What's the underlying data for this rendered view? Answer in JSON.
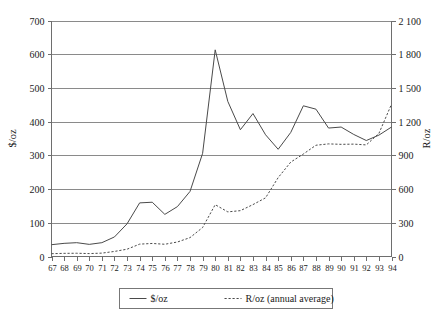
{
  "chart_data": {
    "type": "line",
    "title": "",
    "xlabel": "",
    "ylabel": "$/oz",
    "y2label": "R/oz",
    "grid": true,
    "legend_position": "bottom-center",
    "x": [
      "67",
      "68",
      "69",
      "70",
      "71",
      "72",
      "73",
      "74",
      "75",
      "76",
      "77",
      "78",
      "79",
      "80",
      "81",
      "82",
      "83",
      "84",
      "85",
      "86",
      "87",
      "88",
      "89",
      "90",
      "91",
      "92",
      "93",
      "94"
    ],
    "xlim": [
      67,
      94
    ],
    "ylim": [
      0,
      700
    ],
    "y2lim": [
      0,
      2100
    ],
    "yticks": [
      "0",
      "100",
      "200",
      "300",
      "400",
      "500",
      "600",
      "700"
    ],
    "ytick_values": [
      0,
      100,
      200,
      300,
      400,
      500,
      600,
      700
    ],
    "y2ticks": [
      "0",
      "300",
      "600",
      "900",
      "1 200",
      "1 500",
      "1 800",
      "2 100"
    ],
    "y2tick_values": [
      0,
      300,
      600,
      900,
      1200,
      1500,
      1800,
      2100
    ],
    "series": [
      {
        "name": "$/oz",
        "style": "solid",
        "axis": "left",
        "values": [
          35,
          39,
          41,
          36,
          41,
          58,
          97,
          159,
          161,
          125,
          148,
          193,
          306,
          613,
          460,
          376,
          424,
          361,
          318,
          368,
          447,
          437,
          381,
          384,
          362,
          344,
          360,
          384
        ]
      },
      {
        "name": "R/oz (annual average)",
        "style": "dashed",
        "axis": "right",
        "values": [
          25,
          28,
          29,
          26,
          30,
          45,
          65,
          110,
          116,
          109,
          129,
          168,
          258,
          461,
          397,
          408,
          462,
          522,
          702,
          840,
          912,
          990,
          1002,
          998,
          1000,
          993,
          1095,
          1355
        ]
      }
    ],
    "legend": [
      {
        "label": "$/oz",
        "style": "solid"
      },
      {
        "label": "R/oz (annual average)",
        "style": "dashed"
      }
    ]
  },
  "colors": {
    "line": "#4a4a4a",
    "grid": "#8a8a8a",
    "axis": "#6e6e6e",
    "text": "#1a1a1a",
    "background": "#ffffff"
  }
}
